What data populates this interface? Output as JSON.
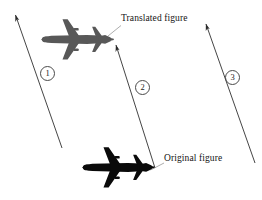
{
  "figure": {
    "type": "diagram",
    "background_color": "#ffffff",
    "width": 262,
    "height": 200
  },
  "labels": {
    "translated_figure": "Translated figure",
    "original_figure": "Original figure"
  },
  "vector_markers": [
    {
      "id": "1",
      "text": "①",
      "digit": "1"
    },
    {
      "id": "2",
      "text": "②",
      "digit": "2"
    },
    {
      "id": "3",
      "text": "③",
      "digit": "3"
    }
  ],
  "shapes": {
    "translated_plane": {
      "name": "airplane-gray",
      "fill": "#585858",
      "nose_direction": "left",
      "center_x": 77,
      "center_y": 40
    },
    "original_plane": {
      "name": "airplane-black",
      "fill": "#0a0a0a",
      "nose_direction": "left",
      "center_x": 118,
      "center_y": 167
    }
  },
  "arrows": {
    "stroke_color": "#303030",
    "arrow_1": {
      "from_x": 62,
      "from_y": 148,
      "to_x": 13,
      "to_y": 12
    },
    "arrow_2": {
      "from_x": 155,
      "from_y": 168,
      "to_x": 114,
      "to_y": 42
    },
    "arrow_3": {
      "from_x": 255,
      "from_y": 163,
      "to_x": 204,
      "to_y": 21
    }
  },
  "leader_lines": {
    "stroke_color": "#7a7a7a",
    "translated": {
      "from_x": 120,
      "from_y": 25,
      "to_x": 108,
      "to_y": 36
    },
    "original": {
      "from_x": 163,
      "from_y": 163,
      "to_x": 150,
      "to_y": 170
    }
  }
}
